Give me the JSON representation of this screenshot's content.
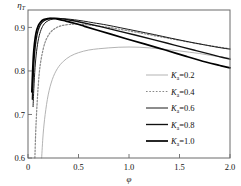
{
  "chart_data": {
    "type": "line",
    "title": "",
    "xlabel": "φ",
    "ylabel": "η",
    "ylabel_sub": "T",
    "xlim": [
      0,
      2.0
    ],
    "ylim": [
      0.6,
      0.94
    ],
    "xticks": [
      "0",
      "0.5",
      "1.0",
      "1.5",
      "2.0"
    ],
    "xtick_values": [
      0,
      0.5,
      1.0,
      1.5,
      2.0
    ],
    "yticks": [
      "0.6",
      "0.7",
      "0.8",
      "0.9"
    ],
    "ytick_values": [
      0.6,
      0.7,
      0.8,
      0.9
    ],
    "grid": false,
    "legend_position": "center-right-inside",
    "series": [
      {
        "name": "Kₐ=0.2",
        "symbol": "K",
        "subscript": "a",
        "value": "0.2",
        "color": "#aaaaaa",
        "width": 0.9,
        "dash": "none",
        "x": [
          0.135,
          0.15,
          0.17,
          0.2,
          0.24,
          0.29,
          0.35,
          0.42,
          0.5,
          0.6,
          0.7,
          0.8,
          0.9,
          1.0,
          1.1,
          1.2,
          1.3,
          1.4,
          1.5,
          1.6,
          1.7,
          1.8,
          1.9,
          2.0
        ],
        "y": [
          0.6,
          0.655,
          0.7,
          0.745,
          0.78,
          0.805,
          0.822,
          0.834,
          0.842,
          0.848,
          0.851,
          0.853,
          0.8545,
          0.855,
          0.8545,
          0.853,
          0.851,
          0.8485,
          0.846,
          0.843,
          0.84,
          0.836,
          0.8325,
          0.829
        ]
      },
      {
        "name": "Kₐ=0.4",
        "symbol": "K",
        "subscript": "a",
        "value": "0.4",
        "color": "#888888",
        "width": 1.2,
        "dash": "dotted",
        "x": [
          0.068,
          0.08,
          0.1,
          0.12,
          0.15,
          0.18,
          0.22,
          0.27,
          0.33,
          0.4,
          0.48,
          0.55,
          0.65,
          0.75,
          0.85,
          1.0,
          1.15,
          1.3,
          1.45,
          1.6,
          1.75,
          1.9,
          2.0
        ],
        "y": [
          0.6,
          0.68,
          0.762,
          0.812,
          0.85,
          0.872,
          0.888,
          0.898,
          0.904,
          0.9065,
          0.9075,
          0.9065,
          0.9045,
          0.9015,
          0.898,
          0.892,
          0.8855,
          0.879,
          0.8725,
          0.866,
          0.86,
          0.8545,
          0.851
        ]
      },
      {
        "name": "Kₐ=0.6",
        "symbol": "K",
        "subscript": "a",
        "value": "0.6",
        "color": "#1a1a1a",
        "width": 1.0,
        "dash": "none",
        "x": [
          0.05,
          0.058,
          0.07,
          0.085,
          0.105,
          0.13,
          0.16,
          0.2,
          0.25,
          0.31,
          0.38,
          0.46,
          0.55,
          0.65,
          0.78,
          0.92,
          1.08,
          1.25,
          1.42,
          1.6,
          1.78,
          1.9,
          2.0
        ],
        "y": [
          0.718,
          0.76,
          0.808,
          0.845,
          0.875,
          0.895,
          0.908,
          0.9155,
          0.9195,
          0.9205,
          0.9195,
          0.9175,
          0.9145,
          0.9105,
          0.9055,
          0.899,
          0.8915,
          0.8835,
          0.875,
          0.8665,
          0.8585,
          0.8535,
          0.85
        ]
      },
      {
        "name": "Kₐ=0.8",
        "symbol": "K",
        "subscript": "a",
        "value": "0.8",
        "color": "#111111",
        "width": 1.35,
        "dash": "none",
        "x": [
          0.043,
          0.05,
          0.06,
          0.072,
          0.09,
          0.112,
          0.14,
          0.175,
          0.22,
          0.275,
          0.34,
          0.42,
          0.51,
          0.62,
          0.75,
          0.9,
          1.07,
          1.25,
          1.45,
          1.65,
          1.82,
          1.92,
          2.0
        ],
        "y": [
          0.735,
          0.778,
          0.824,
          0.857,
          0.884,
          0.901,
          0.9115,
          0.9175,
          0.9205,
          0.921,
          0.9195,
          0.9165,
          0.9125,
          0.907,
          0.9,
          0.8915,
          0.882,
          0.8715,
          0.8595,
          0.8475,
          0.8375,
          0.8315,
          0.827
        ]
      },
      {
        "name": "Kₐ=1.0",
        "symbol": "K",
        "subscript": "a",
        "value": "1.0",
        "color": "#000000",
        "width": 1.7,
        "dash": "none",
        "x": [
          0.038,
          0.045,
          0.053,
          0.064,
          0.08,
          0.1,
          0.125,
          0.155,
          0.195,
          0.245,
          0.305,
          0.375,
          0.46,
          0.56,
          0.68,
          0.82,
          0.98,
          1.16,
          1.36,
          1.56,
          1.76,
          1.9,
          2.0
        ],
        "y": [
          0.752,
          0.794,
          0.833,
          0.863,
          0.888,
          0.903,
          0.9125,
          0.918,
          0.9205,
          0.9205,
          0.9185,
          0.9145,
          0.9095,
          0.9025,
          0.894,
          0.8845,
          0.8735,
          0.8615,
          0.848,
          0.834,
          0.8205,
          0.8125,
          0.807
        ]
      }
    ],
    "annotations": []
  },
  "axis": {
    "y_axis_label_name": "eta-T",
    "x_axis_label_name": "phi"
  },
  "legend": {
    "items": [
      {
        "label": "K",
        "sub": "a",
        "eq": "=0.2"
      },
      {
        "label": "K",
        "sub": "a",
        "eq": "=0.4"
      },
      {
        "label": "K",
        "sub": "a",
        "eq": "=0.6"
      },
      {
        "label": "K",
        "sub": "a",
        "eq": "=0.8"
      },
      {
        "label": "K",
        "sub": "a",
        "eq": "=1.0"
      }
    ]
  },
  "colors": {
    "frame": "#6a6a6a",
    "background": "#ffffff",
    "text": "#111111"
  }
}
